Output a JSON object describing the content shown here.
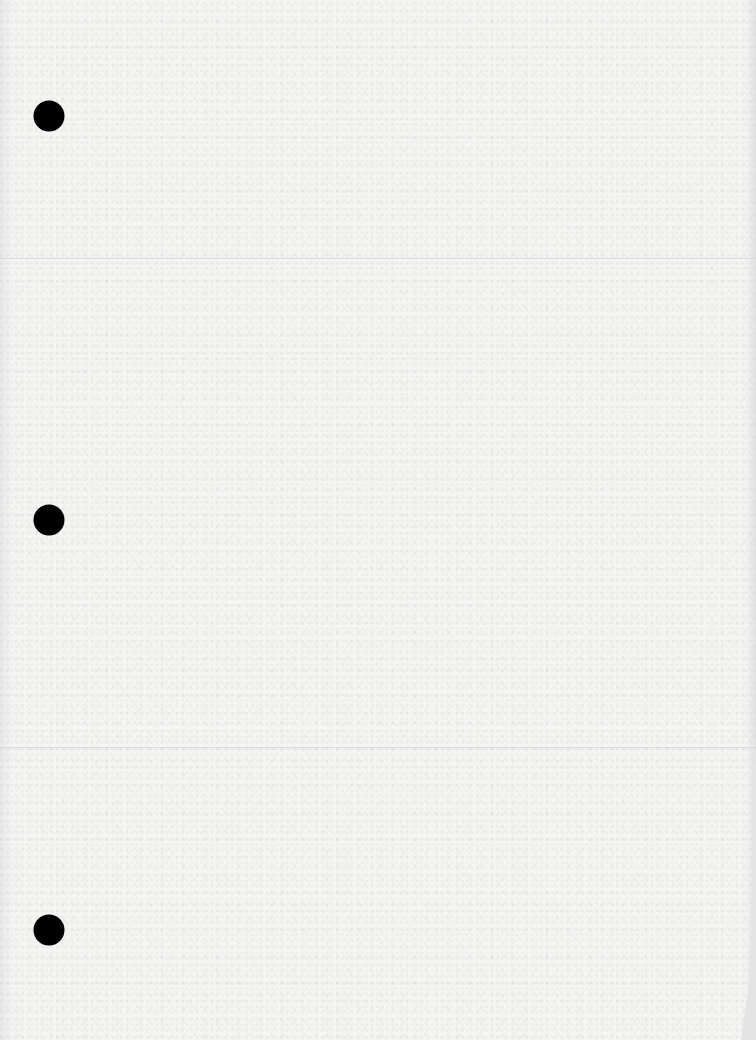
{
  "document": {
    "type": "blank loose-leaf paper",
    "paper_color": "#f4f4f3",
    "background_color": "#e4e4e4",
    "hole_color": "#000000",
    "punch_holes": [
      {
        "position": "top",
        "cx": 49,
        "cy": 116
      },
      {
        "position": "middle",
        "cx": 49,
        "cy": 520
      },
      {
        "position": "bottom",
        "cx": 49,
        "cy": 930
      }
    ],
    "crease_lines_y": [
      258,
      747
    ]
  }
}
